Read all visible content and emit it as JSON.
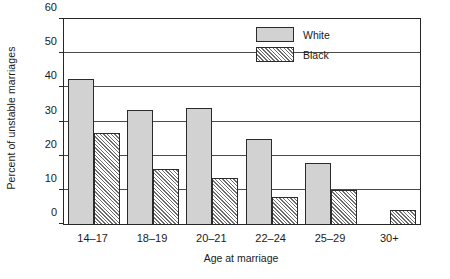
{
  "chart_data": {
    "type": "bar",
    "title": "",
    "xlabel": "Age at marriage",
    "ylabel": "Percent of unstable marriages",
    "categories": [
      "14–17",
      "18–19",
      "20–21",
      "22–24",
      "25–29",
      "30+"
    ],
    "series": [
      {
        "name": "White",
        "values": [
          42.5,
          33.5,
          34.0,
          24.8,
          18.0,
          null
        ]
      },
      {
        "name": "Black",
        "values": [
          26.5,
          16.0,
          13.5,
          7.8,
          10.0,
          4.2
        ]
      }
    ],
    "ylim": [
      0,
      60
    ],
    "yticks": [
      0,
      10,
      20,
      30,
      40,
      50,
      60
    ],
    "ytick_labels": [
      "0",
      "10",
      "20",
      "30",
      "40",
      "50",
      "60"
    ],
    "grid": "horizontal",
    "legend_position": "top-center-right",
    "colors": {
      "white_series": "#d2d2d2",
      "black_series_hatch": "#6e6e6e",
      "axis": "#262626",
      "gridline": "#4a4a4a",
      "background": "#ffffff"
    }
  },
  "legend": {
    "entries": [
      {
        "label": "White",
        "swatch": "solid-gray-swatch"
      },
      {
        "label": "Black",
        "swatch": "diagonal-hatch-swatch"
      }
    ]
  }
}
